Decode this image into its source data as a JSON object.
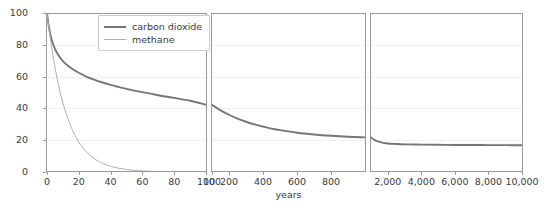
{
  "chart_data": {
    "type": "line",
    "title": "",
    "xlabel": "years",
    "ylabel": "percent remaining",
    "ylim": [
      0,
      100
    ],
    "yticks": [
      0,
      20,
      40,
      60,
      80,
      100
    ],
    "ytick_labels": [
      "0",
      "20",
      "40",
      "60",
      "80",
      "100"
    ],
    "grid": true,
    "legend_position": "upper center",
    "broken_axis": true,
    "panels": [
      {
        "name": "panel-near-term",
        "xlim": [
          0,
          100
        ],
        "xticks": [
          0,
          20,
          40,
          60,
          80,
          100
        ],
        "xtick_labels": [
          "0",
          "20",
          "40",
          "60",
          "80",
          "100"
        ]
      },
      {
        "name": "panel-mid-term",
        "xlim": [
          100,
          1000
        ],
        "xticks": [
          100,
          200,
          400,
          600,
          800
        ],
        "xtick_labels": [
          "100",
          "200",
          "400",
          "600",
          "800"
        ]
      },
      {
        "name": "panel-long-term",
        "xlim": [
          1000,
          10000
        ],
        "xticks": [
          2000,
          4000,
          6000,
          8000,
          10000
        ],
        "xtick_labels": [
          "2,000",
          "4,000",
          "6,000",
          "8,000",
          "10,000"
        ]
      }
    ],
    "series": [
      {
        "name": "carbon dioxide",
        "color": "#767676",
        "width": 1.9,
        "x": [
          0,
          1,
          2,
          3,
          5,
          7,
          10,
          13,
          16,
          20,
          25,
          30,
          35,
          40,
          45,
          50,
          60,
          70,
          80,
          90,
          100,
          150,
          200,
          250,
          300,
          350,
          400,
          450,
          500,
          600,
          700,
          800,
          900,
          1000,
          1200,
          1500,
          2000,
          2500,
          3000,
          4000,
          5000,
          6000,
          7000,
          8000,
          9000,
          10000
        ],
        "y": [
          100,
          92.5,
          87.0,
          83.0,
          77.5,
          73.8,
          69.8,
          67.0,
          64.8,
          62.4,
          59.9,
          58.0,
          56.3,
          54.8,
          53.5,
          52.3,
          50.2,
          48.3,
          46.6,
          44.8,
          42.3,
          38.8,
          36.0,
          33.6,
          31.6,
          29.9,
          28.5,
          27.3,
          26.3,
          24.7,
          23.6,
          22.8,
          22.2,
          21.8,
          20.2,
          18.9,
          17.9,
          17.6,
          17.4,
          17.2,
          17.1,
          17.0,
          17.0,
          16.9,
          16.9,
          16.8
        ]
      },
      {
        "name": "methane",
        "color": "#b0b0b0",
        "width": 1.0,
        "x": [
          0,
          1,
          2,
          3,
          4,
          5,
          7,
          9,
          12,
          15,
          18,
          21,
          25,
          30,
          35,
          40,
          45,
          50,
          55,
          60,
          70,
          80,
          90,
          100
        ],
        "y": [
          100,
          92.0,
          84.6,
          77.9,
          71.7,
          65.9,
          55.8,
          47.2,
          36.8,
          28.7,
          22.3,
          17.4,
          12.4,
          8.2,
          5.4,
          3.6,
          2.4,
          1.6,
          1.0,
          0.7,
          0.3,
          0.1,
          0.05,
          0.0
        ]
      }
    ]
  }
}
